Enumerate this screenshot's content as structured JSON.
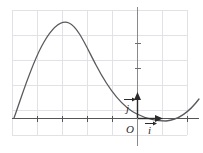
{
  "figure": {
    "type": "coordinate-plane-curve-plot",
    "background_color": "#ffffff",
    "grid": {
      "visible": true,
      "color": "#e2e2e6",
      "line_width": 1,
      "x_lines": [
        12,
        37,
        62,
        87,
        112,
        137,
        162,
        187
      ],
      "y_lines": [
        10,
        35,
        60,
        85,
        110,
        135
      ],
      "spacing_px": 25,
      "left": 12,
      "right": 187,
      "top": 10,
      "bottom": 135
    },
    "axes": {
      "color": "#555558",
      "line_width": 1.4,
      "x_axis": {
        "y_px": 118,
        "x_start": 12,
        "x_end": 198
      },
      "y_axis": {
        "x_px": 137,
        "y_start": 8,
        "y_end": 145
      },
      "x_ticks_px": [
        37,
        62,
        87,
        112,
        162,
        187
      ],
      "y_ticks_px": [
        43,
        68,
        93
      ],
      "tick_length": 5
    },
    "origin_label": "O",
    "vectors": [
      {
        "name": "i-hat",
        "label": "i",
        "accent": "arrow",
        "direction": "right",
        "from_px": [
          137,
          118
        ],
        "to_px": [
          162,
          118
        ],
        "label_pos_px": [
          147,
          133
        ],
        "color": "#2b2b2b"
      },
      {
        "name": "j-hat",
        "label": "j",
        "accent": "arrow",
        "direction": "up",
        "from_px": [
          137,
          118
        ],
        "to_px": [
          137,
          93
        ],
        "label_pos_px": [
          128,
          110
        ],
        "color": "#2b2b2b"
      }
    ],
    "curve": {
      "name": "cubic-like-curve",
      "color": "#5a5a5e",
      "line_width": 1.3,
      "description": "rises steeply from the x-axis at the left, peaks near the top-left-center, descends through the x-axis just right of the origin, reaches a local minimum, then rises again at the right edge",
      "x_intercepts_px": [
        14,
        155
      ],
      "peak_px": [
        68,
        23
      ],
      "local_min_px": [
        166,
        121
      ],
      "start_px": [
        14,
        118
      ],
      "end_px": [
        198,
        100
      ]
    },
    "origin_label_pos_px": [
      128,
      133
    ]
  }
}
